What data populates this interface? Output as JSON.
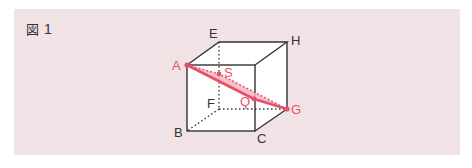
{
  "figure": {
    "label_prefix": "図",
    "label_number": "1"
  },
  "vertices": {
    "A": "A",
    "B": "B",
    "C": "C",
    "E": "E",
    "F": "F",
    "G": "G",
    "H": "H",
    "S": "S",
    "Q": "Q"
  },
  "colors": {
    "panel_bg": "#f1e3e5",
    "edge": "#333333",
    "accent": "#e8506a",
    "accent_fill": "#f6b6c0"
  }
}
